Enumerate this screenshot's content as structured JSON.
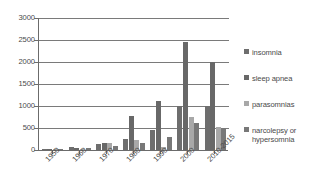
{
  "chart_data": {
    "type": "bar",
    "title": "",
    "xlabel": "",
    "ylabel": "",
    "ylim": [
      0,
      3000
    ],
    "yticks": [
      0,
      500,
      1000,
      1500,
      2000,
      2500,
      3000
    ],
    "ytick_labels": [
      "0",
      "500",
      "1000",
      "1500",
      "2000",
      "2500",
      "3000"
    ],
    "grid": true,
    "legend_position": "right",
    "categories": [
      "1950",
      "1960",
      "1970",
      "1980",
      "1990",
      "2000",
      "2010-2015"
    ],
    "series": [
      {
        "name": "insomnia",
        "color": "#6e6e6e",
        "values": [
          25,
          70,
          140,
          250,
          460,
          1000,
          1000
        ]
      },
      {
        "name": "sleep apnea",
        "color": "#686868",
        "values": [
          30,
          45,
          165,
          780,
          1110,
          2450,
          2010
        ]
      },
      {
        "name": "parasomnias",
        "color": "#a8a8a8",
        "values": [
          10,
          15,
          155,
          225,
          60,
          740,
          520
        ]
      },
      {
        "name": "narcolepsy or hypersomnia",
        "color": "#787878",
        "values": [
          15,
          55,
          95,
          155,
          285,
          615,
          500
        ]
      }
    ]
  },
  "legend": {
    "items": [
      {
        "label": "insomnia"
      },
      {
        "label": "sleep apnea"
      },
      {
        "label": "parasomnias"
      },
      {
        "label": "narcolepsy or\nhypersomnia"
      }
    ]
  }
}
